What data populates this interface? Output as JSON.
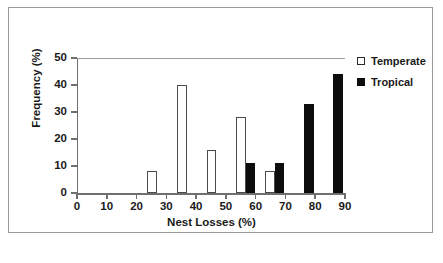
{
  "chart_data": {
    "type": "bar",
    "title": "",
    "subtitle": "",
    "xlabel": "Nest Losses (%)",
    "ylabel": "Frequency (%)",
    "xlim": [
      0,
      90
    ],
    "ylim": [
      0,
      50
    ],
    "xticks": [
      0,
      10,
      20,
      30,
      40,
      50,
      60,
      70,
      80,
      90
    ],
    "yticks": [
      0,
      10,
      20,
      30,
      40,
      50
    ],
    "grid": false,
    "legend_position": "top-right",
    "bar_width": 3.2,
    "series": [
      {
        "name": "Temperate",
        "color": "#ffffff",
        "edge_color": "#4a4a4a",
        "style": "open",
        "points": [
          {
            "x": 23.2,
            "value": 8
          },
          {
            "x": 33.4,
            "value": 40
          },
          {
            "x": 43.2,
            "value": 16
          },
          {
            "x": 53.2,
            "value": 28
          },
          {
            "x": 62.8,
            "value": 8
          }
        ]
      },
      {
        "name": "Tropical",
        "color": "#0d0d0d",
        "edge_color": "#0d0d0d",
        "style": "filled",
        "points": [
          {
            "x": 56.4,
            "value": 11
          },
          {
            "x": 66.0,
            "value": 11
          },
          {
            "x": 76.0,
            "value": 33
          },
          {
            "x": 85.8,
            "value": 44
          }
        ]
      }
    ]
  },
  "legend": {
    "items": [
      {
        "label": "Temperate",
        "style": "open"
      },
      {
        "label": "Tropical",
        "style": "filled"
      }
    ]
  },
  "caption": ""
}
